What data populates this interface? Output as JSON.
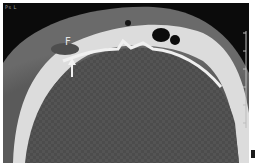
{
  "image": {
    "kind": "axial CT scan, bone window",
    "corner_label": "Ps L",
    "annotations": [
      {
        "label": "F",
        "type": "text-label"
      },
      {
        "type": "arrow",
        "direction": "up"
      }
    ],
    "colors": {
      "background_air": "#0a0a0a",
      "soft_tissue": "#505050",
      "bone": "#e8e8e8",
      "page": "#ffffff"
    }
  }
}
